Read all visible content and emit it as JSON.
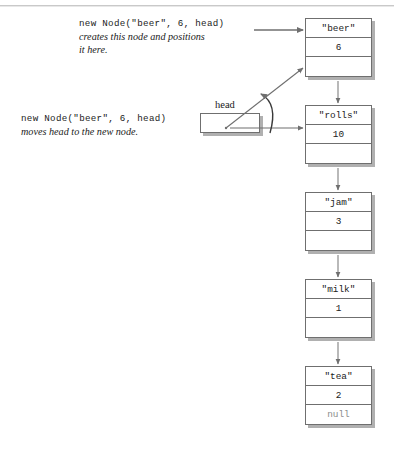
{
  "diagram": {
    "kind": "linked-list-insertion",
    "head_variable": {
      "label": "head"
    },
    "annotations": [
      {
        "id": "create",
        "code": "new Node(\"beer\", 6, head)",
        "note_line_1": "creates this node and positions",
        "note_line_2": "it here."
      },
      {
        "id": "move",
        "code": "new Node(\"beer\", 6, head)",
        "note_line_1": "moves head to the new node.",
        "note_line_2": ""
      }
    ],
    "nodes": [
      {
        "item": "\"beer\"",
        "count": "6",
        "next": ""
      },
      {
        "item": "\"rolls\"",
        "count": "10",
        "next": ""
      },
      {
        "item": "\"jam\"",
        "count": "3",
        "next": ""
      },
      {
        "item": "\"milk\"",
        "count": "1",
        "next": ""
      },
      {
        "item": "\"tea\"",
        "count": "2",
        "next": "null"
      }
    ],
    "colors": {
      "stroke": "#6f6f6f",
      "shadow": "#b0b0b0",
      "text": "#1a1a1a",
      "muted_text": "#8c8c8c",
      "background": "#ffffff"
    }
  }
}
